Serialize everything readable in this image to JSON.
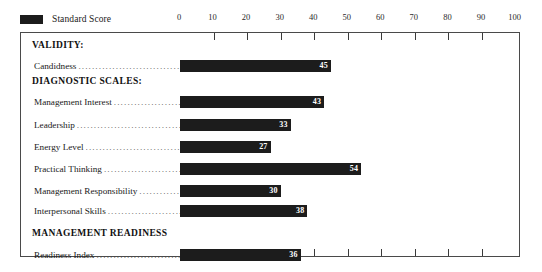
{
  "legend": {
    "swatch_color": "#1c1c1c",
    "label": "Standard Score"
  },
  "axis": {
    "ticks": [
      "0",
      "10",
      "20",
      "30",
      "40",
      "50",
      "60",
      "70",
      "80",
      "90",
      "100"
    ]
  },
  "sections": [
    {
      "title": "VALIDITY:"
    },
    {
      "title": "DIAGNOSTIC SCALES:"
    },
    {
      "title": "MANAGEMENT READINESS"
    }
  ],
  "rows": [
    {
      "label": "Candidness",
      "value": "45"
    },
    {
      "label": "Management Interest",
      "value": "43"
    },
    {
      "label": "Leadership",
      "value": "33"
    },
    {
      "label": "Energy Level",
      "value": "27"
    },
    {
      "label": "Practical Thinking",
      "value": "54"
    },
    {
      "label": "Management Responsibility",
      "value": "30"
    },
    {
      "label": "Interpersonal Skills",
      "value": "38"
    },
    {
      "label": "Readiness Index",
      "value": "36"
    }
  ],
  "chart_data": {
    "type": "bar",
    "orientation": "horizontal",
    "title": "",
    "xlabel": "",
    "ylabel": "",
    "xlim": [
      0,
      100
    ],
    "xticks": [
      0,
      10,
      20,
      30,
      40,
      50,
      60,
      70,
      80,
      90,
      100
    ],
    "grid": false,
    "legend": [
      "Standard Score"
    ],
    "legend_position": "top-left",
    "bar_color": "#1c1c1c",
    "groups": [
      {
        "name": "VALIDITY:",
        "categories": [
          "Candidness"
        ],
        "values": [
          45
        ]
      },
      {
        "name": "DIAGNOSTIC SCALES:",
        "categories": [
          "Management Interest",
          "Leadership",
          "Energy Level",
          "Practical Thinking",
          "Management Responsibility",
          "Interpersonal Skills"
        ],
        "values": [
          43,
          33,
          27,
          54,
          30,
          38
        ]
      },
      {
        "name": "MANAGEMENT READINESS",
        "categories": [
          "Readiness Index"
        ],
        "values": [
          36
        ]
      }
    ],
    "categories": [
      "Candidness",
      "Management Interest",
      "Leadership",
      "Energy Level",
      "Practical Thinking",
      "Management Responsibility",
      "Interpersonal Skills",
      "Readiness Index"
    ],
    "values": [
      45,
      43,
      33,
      27,
      54,
      30,
      38,
      36
    ],
    "series": [
      {
        "name": "Standard Score",
        "values": [
          45,
          43,
          33,
          27,
          54,
          30,
          38,
          36
        ]
      }
    ]
  }
}
